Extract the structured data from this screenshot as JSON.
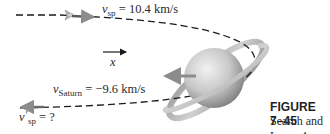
{
  "figure": {
    "caption": {
      "title": "FIGURE 7–45",
      "text": "Search and Learn 4."
    },
    "labels": {
      "v_sp": {
        "symbol": "v",
        "subscript": "sp",
        "equals": " = 10.4 km/s"
      },
      "x_axis": {
        "symbol": "x"
      },
      "v_saturn": {
        "symbol": "v",
        "subscript": "Saturn",
        "equals": " = −9.6 km/s"
      },
      "v_sp_prime": {
        "symbol": "v",
        "prime": "′",
        "subscript": "sp",
        "equals": " = ?"
      }
    },
    "objects": {
      "spacecraft": "spacecraft-icon",
      "planet": "saturn",
      "trajectory": "dashed-path"
    },
    "colors": {
      "path": "#1a1a1a",
      "arrow_gray": "#8c8c8c",
      "planet_light": "#e6e6e6",
      "planet_dark": "#8a8a8a",
      "text": "#2a2a2a"
    }
  }
}
